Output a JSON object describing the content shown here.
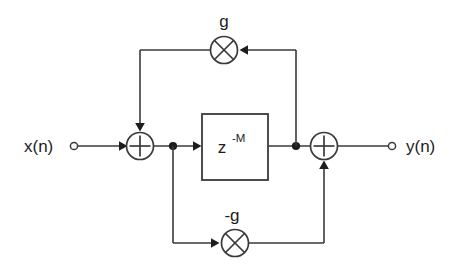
{
  "diagram": {
    "background_color": "#ffffff",
    "line_color": "#3a3a3a",
    "text_color": "#1d1d1d",
    "input": {
      "label": "x(n)",
      "terminal_icon": "open-circle-terminal"
    },
    "output": {
      "label": "y(n)",
      "terminal_icon": "open-circle-terminal"
    },
    "delay_block": {
      "base": "z",
      "exponent": "-M",
      "full_label": "z-M"
    },
    "adders": [
      {
        "id": "left",
        "glyph": "+",
        "name": "summing-junction-left"
      },
      {
        "id": "right",
        "glyph": "+",
        "name": "summing-junction-right"
      }
    ],
    "multipliers": [
      {
        "id": "top",
        "glyph": "x",
        "gain_label": "g",
        "name": "multiplier-top"
      },
      {
        "id": "bottom",
        "glyph": "x",
        "gain_label": "-g",
        "name": "multiplier-bottom"
      }
    ],
    "junction_dots": [
      {
        "id": "after-left-adder"
      },
      {
        "id": "after-delay"
      }
    ]
  }
}
